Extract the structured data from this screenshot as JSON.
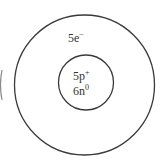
{
  "diagram": {
    "type": "atom-model",
    "shell": {
      "label_count": "5e",
      "label_charge": "−"
    },
    "nucleus": {
      "protons": {
        "count": "5p",
        "charge": "+"
      },
      "neutrons": {
        "count": "6n",
        "charge": "0"
      }
    },
    "colors": {
      "stroke": "#3a3a3a",
      "text": "#333333",
      "background": "#ffffff"
    }
  }
}
